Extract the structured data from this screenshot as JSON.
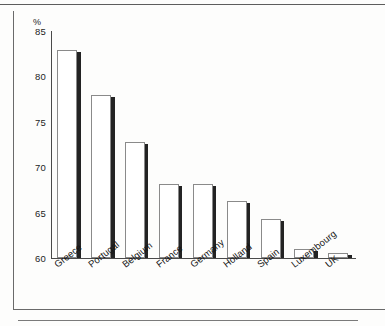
{
  "chart_data": {
    "type": "bar",
    "title": "",
    "subtitle": "",
    "xlabel": "",
    "ylabel": "%",
    "unit_label": "%",
    "categories": [
      "Greece",
      "Portugal",
      "Belgium",
      "France",
      "Germany",
      "Holland",
      "Spain",
      "Luxembourg",
      "UK"
    ],
    "values": [
      82.9,
      77.9,
      72.8,
      68.1,
      68.1,
      66.3,
      64.3,
      61.0,
      60.6
    ],
    "ylim": [
      60,
      85
    ],
    "ytick_labels": [
      "60",
      "65",
      "70",
      "75",
      "80",
      "85"
    ],
    "ytick_values": [
      60,
      65,
      70,
      75,
      80,
      85
    ],
    "grid": false,
    "legend": null,
    "series": [
      {
        "name": "",
        "values": [
          82.9,
          77.9,
          72.8,
          68.1,
          68.1,
          66.3,
          64.3,
          61.0,
          60.6
        ]
      }
    ],
    "bar_style": {
      "fill": "#ffffff",
      "outline": "#8a8a8a",
      "shadow": "#232323"
    },
    "axis_color": "#4a4a4a",
    "background": "#fdfdfc"
  }
}
